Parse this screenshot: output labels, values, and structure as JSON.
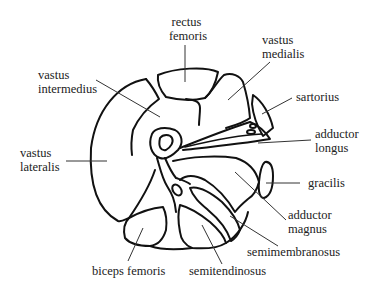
{
  "diagram": {
    "labels": {
      "rectus_femoris": [
        "rectus",
        "femoris"
      ],
      "vastus_medialis": [
        "vastus",
        "medialis"
      ],
      "vastus_intermedius": [
        "vastus",
        "intermedius"
      ],
      "sartorius": [
        "sartorius"
      ],
      "adductor_longus": [
        "adductor",
        "longus"
      ],
      "vastus_lateralis": [
        "vastus",
        "lateralis"
      ],
      "gracilis": [
        "gracilis"
      ],
      "adductor_magnus": [
        "adductor",
        "magnus"
      ],
      "semimembranosus": [
        "semimembranosus"
      ],
      "biceps_femoris": [
        "biceps femoris"
      ],
      "semitendinosus": [
        "semitendinosus"
      ]
    },
    "colors": {
      "line": "#111111",
      "text": "#222222",
      "background": "#ffffff"
    }
  }
}
